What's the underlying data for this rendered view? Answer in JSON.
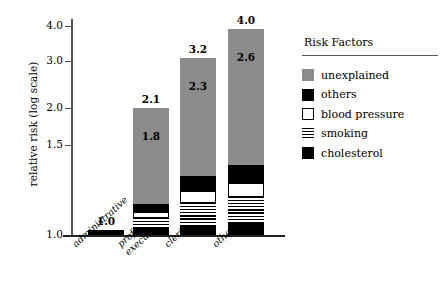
{
  "chart_data": {
    "type": "bar",
    "stacked": true,
    "title": "",
    "xlabel": "",
    "ylabel": "relative risk (log scale)",
    "yscale": "log",
    "ylim": [
      1.0,
      4.25
    ],
    "grid": false,
    "legend_position": "right",
    "legend_title": "Risk Factors",
    "categories": [
      "administrative",
      "professional/\nexecutive",
      "clerical",
      "other"
    ],
    "category_lines": [
      [
        "administrative"
      ],
      [
        "professional/",
        "executive"
      ],
      [
        "clerical"
      ],
      [
        "other"
      ]
    ],
    "series": [
      {
        "name": "cholesterol",
        "values": [
          1.02,
          1.06,
          1.09,
          1.1
        ]
      },
      {
        "name": "smoking",
        "values": [
          1.02,
          1.11,
          1.21,
          1.24
        ]
      },
      {
        "name": "blood pressure",
        "values": [
          1.02,
          1.14,
          1.32,
          1.38
        ]
      },
      {
        "name": "others",
        "values": [
          1.02,
          1.22,
          1.47,
          1.56
        ]
      },
      {
        "name": "unexplained",
        "values": [
          1.02,
          2.1,
          3.2,
          4.0
        ]
      }
    ],
    "series_note": "values are cumulative tops of each stacked segment on the log axis",
    "bar_total_labels": [
      "1.0",
      "2.1",
      "3.2",
      "4.0"
    ],
    "bar_inner_labels": [
      "",
      "1.8",
      "2.3",
      "2.6"
    ],
    "yticks": [
      1.0,
      1.5,
      2.0,
      3.0,
      4.0
    ],
    "ytick_labels": [
      "1.0",
      "1.5",
      "2.0",
      "3.0",
      "4.0"
    ],
    "colors": {
      "unexplained": "#8c8c8c",
      "others": "#000000",
      "blood pressure": "#ffffff",
      "smoking": "#8c8c8c",
      "cholesterol": "#000000",
      "axis": "#555555",
      "text": "#000000",
      "background": "#ffffff"
    }
  },
  "axis": {
    "y_label": "relative risk (log scale)",
    "ticks": [
      {
        "label": "4.0",
        "top": 26
      },
      {
        "label": "3.0",
        "top": 61
      },
      {
        "label": "2.0",
        "top": 108
      },
      {
        "label": "1.5",
        "top": 145
      },
      {
        "label": "1.0",
        "top": 235
      }
    ]
  },
  "bars": [
    {
      "name": "administrative",
      "label_lines": [
        "administrative"
      ],
      "total_label": "1.0",
      "inner_label": "",
      "left": 88,
      "width": 36,
      "top": 230,
      "height": 5,
      "segments": [
        {
          "key": "cholesterol",
          "height": 5
        }
      ]
    },
    {
      "name": "professional-executive",
      "label_lines": [
        "professional/",
        "executive"
      ],
      "total_label": "2.1",
      "inner_label": "1.8",
      "left": 133,
      "width": 36,
      "top": 108,
      "height": 127,
      "segments": [
        {
          "key": "unexplained",
          "height": 96
        },
        {
          "key": "others",
          "height": 8
        },
        {
          "key": "bloodpressure",
          "height": 6
        },
        {
          "key": "smoking",
          "height": 10
        },
        {
          "key": "cholesterol",
          "height": 7
        }
      ]
    },
    {
      "name": "clerical",
      "label_lines": [
        "clerical"
      ],
      "total_label": "3.2",
      "inner_label": "2.3",
      "left": 180,
      "width": 36,
      "top": 58,
      "height": 177,
      "segments": [
        {
          "key": "unexplained",
          "height": 118
        },
        {
          "key": "others",
          "height": 15
        },
        {
          "key": "bloodpressure",
          "height": 12
        },
        {
          "key": "smoking",
          "height": 22
        },
        {
          "key": "cholesterol",
          "height": 10
        }
      ]
    },
    {
      "name": "other",
      "label_lines": [
        "other"
      ],
      "total_label": "4.0",
      "inner_label": "2.6",
      "left": 228,
      "width": 36,
      "top": 29,
      "height": 206,
      "segments": [
        {
          "key": "unexplained",
          "height": 136
        },
        {
          "key": "others",
          "height": 18
        },
        {
          "key": "bloodpressure",
          "height": 14
        },
        {
          "key": "smoking",
          "height": 26
        },
        {
          "key": "cholesterol",
          "height": 12
        }
      ]
    }
  ],
  "legend": {
    "title": "Risk Factors",
    "items": [
      {
        "key": "unexplained",
        "label": "unexplained"
      },
      {
        "key": "others",
        "label": "others"
      },
      {
        "key": "bloodpressure",
        "label": "blood pressure"
      },
      {
        "key": "smoking",
        "label": "smoking"
      },
      {
        "key": "cholesterol",
        "label": "cholesterol"
      }
    ]
  }
}
